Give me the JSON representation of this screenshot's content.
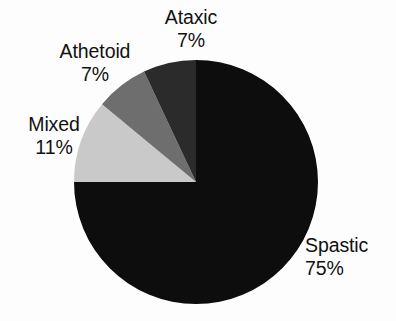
{
  "chart_data": {
    "type": "pie",
    "title": "",
    "subtitle": "",
    "xlabel": "",
    "ylabel": "",
    "legend_position": "none",
    "grid": false,
    "value_unit": "%",
    "categories": [
      "Spastic",
      "Mixed",
      "Athetoid",
      "Ataxic"
    ],
    "values": [
      75,
      11,
      7,
      7
    ],
    "slices": [
      {
        "name": "Spastic",
        "value": 75,
        "value_label": "75%",
        "color": "#0d0d0d",
        "start_angle_deg": 0,
        "end_angle_deg": 270
      },
      {
        "name": "Mixed",
        "value": 11,
        "value_label": "11%",
        "color": "#c9c9c9",
        "start_angle_deg": 270,
        "end_angle_deg": 309.6
      },
      {
        "name": "Athetoid",
        "value": 7,
        "value_label": "7%",
        "color": "#6e6e6e",
        "start_angle_deg": 309.6,
        "end_angle_deg": 334.8
      },
      {
        "name": "Ataxic",
        "value": 7,
        "value_label": "7%",
        "color": "#2b2b2b",
        "start_angle_deg": 334.8,
        "end_angle_deg": 360
      }
    ]
  },
  "labels": {
    "ataxic": {
      "name": "Ataxic",
      "value": "7%"
    },
    "athetoid": {
      "name": "Athetoid",
      "value": "7%"
    },
    "mixed": {
      "name": "Mixed",
      "value": "11%"
    },
    "spastic": {
      "name": "Spastic",
      "value": "75%"
    }
  },
  "geometry": {
    "center_x": 196,
    "center_y": 182,
    "radius": 122
  },
  "colors": {
    "background": "#fdfdfd",
    "text": "#111111",
    "spastic": "#0d0d0d",
    "mixed": "#c9c9c9",
    "athetoid": "#6e6e6e",
    "ataxic": "#2b2b2b"
  }
}
